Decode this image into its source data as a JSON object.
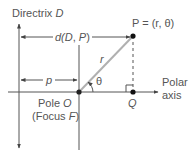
{
  "figure": {
    "directrix_label": "Directrix",
    "directrix_symbol": "D",
    "distance_label_prefix": "d(",
    "distance_D": "D",
    "distance_sep": ", ",
    "distance_P": "P",
    "distance_label_suffix": ")",
    "point_P_label": "P = (r, θ)",
    "r_label": "r",
    "theta_label": "θ",
    "p_label": "p",
    "pole_label": "Pole",
    "pole_symbol": "O",
    "focus_label_open": "(Focus ",
    "focus_symbol": "F",
    "focus_label_close": ")",
    "Q_label": "Q",
    "polar_axis_line1": "Polar",
    "polar_axis_line2": "axis"
  },
  "colors": {
    "line": "#555555",
    "segment_r": "#b0b0b0",
    "point": "#111111"
  }
}
